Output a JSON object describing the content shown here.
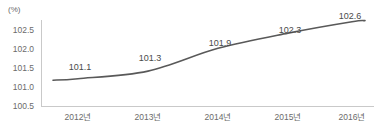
{
  "chart_data": {
    "type": "line",
    "title": "",
    "subtitle": "",
    "xlabel": "",
    "ylabel": "",
    "unit_label": "(%)",
    "categories": [
      "2012년",
      "2013년",
      "2014년",
      "2015년",
      "2016년"
    ],
    "values": [
      101.1,
      101.3,
      101.9,
      102.3,
      102.6
    ],
    "point_labels": [
      "101.1",
      "101.3",
      "101.9",
      "102.3",
      "102.6"
    ],
    "series": [
      {
        "name": "",
        "values": [
          101.1,
          101.3,
          101.9,
          102.3,
          102.6
        ]
      }
    ],
    "ylim": [
      100.5,
      102.75
    ],
    "yticks": [
      102.5,
      102.0,
      101.5,
      101.0,
      100.5
    ],
    "ytick_labels": [
      "102.5",
      "102.0",
      "101.5",
      "101.0",
      "100.5"
    ],
    "grid": false,
    "legend": false,
    "legend_position": "none",
    "line_color": "#595959",
    "axis_color": "#c9c9c9",
    "text_color": "#6b6b6b",
    "label_color": "#4a4a4a",
    "background_color": "#ffffff",
    "markers": false,
    "smooth": true
  }
}
